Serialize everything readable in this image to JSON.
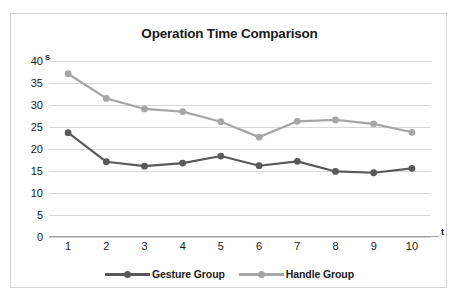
{
  "chart_data": {
    "type": "line",
    "title": "Operation Time Comparison",
    "xlabel": "t",
    "ylabel": "s",
    "x": [
      1,
      2,
      3,
      4,
      5,
      6,
      7,
      8,
      9,
      10
    ],
    "categories": [
      "1",
      "2",
      "3",
      "4",
      "5",
      "6",
      "7",
      "8",
      "9",
      "10"
    ],
    "yticks": [
      "0",
      "5",
      "10",
      "15",
      "20",
      "25",
      "30",
      "35",
      "40"
    ],
    "ylim": [
      0,
      40
    ],
    "grid": true,
    "legend_position": "bottom",
    "series": [
      {
        "name": "Gesture Group",
        "color": "#595959",
        "values": [
          23.7,
          17.1,
          16.1,
          16.8,
          18.4,
          16.2,
          17.2,
          14.9,
          14.6,
          15.6
        ]
      },
      {
        "name": "Handle Group",
        "color": "#a6a6a6",
        "values": [
          37.1,
          31.5,
          29.1,
          28.5,
          26.2,
          22.7,
          26.3,
          26.6,
          25.7,
          23.8
        ]
      }
    ]
  },
  "legend": {
    "items": [
      {
        "label": "Gesture Group"
      },
      {
        "label": "Handle Group"
      }
    ]
  }
}
